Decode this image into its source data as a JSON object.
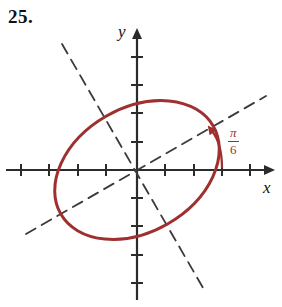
{
  "exercise": {
    "number": "25."
  },
  "figure": {
    "type": "rotated-ellipse-graph",
    "axes": {
      "x_label": "x",
      "y_label": "y",
      "origin": [
        137,
        170
      ],
      "tick_spacing_px": 28.3,
      "x_axis_from": [
        6,
        170
      ],
      "x_axis_to": [
        276,
        170
      ],
      "y_axis_from": [
        137,
        300
      ],
      "y_axis_to": [
        137,
        28
      ],
      "x_ticks": [
        21,
        49,
        78,
        106,
        165,
        194,
        222,
        250
      ],
      "y_ticks": [
        57,
        85,
        113,
        142,
        198,
        226,
        255,
        283
      ],
      "tick_half_len": 6
    },
    "ellipse": {
      "center": [
        137,
        170
      ],
      "semi_major_px": 88,
      "semi_minor_px": 62,
      "rotation_deg": -30,
      "stroke": "#9e3030",
      "stroke_width": 3,
      "fill": "none"
    },
    "major_axis_dashed": {
      "from": [
        26,
        234
      ],
      "to": [
        266,
        96
      ],
      "stroke": "#3a3a3a",
      "dash": "10,7"
    },
    "minor_axis_dashed": {
      "from": [
        62,
        44
      ],
      "to": [
        206,
        292
      ],
      "stroke": "#3a3a3a",
      "dash": "10,7"
    },
    "angle_arc": {
      "label_numerator": "π",
      "label_denominator": "6",
      "color": "#9e3030",
      "vertex_x_px": 222,
      "sweep_deg": 30
    }
  },
  "colors": {
    "curve": "#9e3030",
    "axis": "#2b2b2b",
    "dashed": "#3a3a3a",
    "text": "#111111"
  }
}
